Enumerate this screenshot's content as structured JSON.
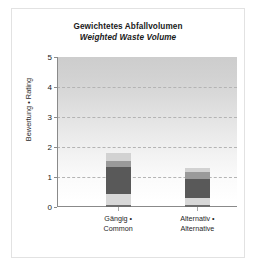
{
  "chart_data": {
    "type": "bar",
    "subtype": "stacked-bar",
    "title": "Gewichtetes Abfallvolumen",
    "subtitle": "Weighted Waste Volume",
    "xlabel": "",
    "ylabel": "Bewertung • Rating",
    "ylim": [
      0,
      5
    ],
    "yticks": [
      "0",
      "1",
      "2",
      "3",
      "4",
      "5"
    ],
    "grid": "horizontal-dashed",
    "legend": "none",
    "categories": [
      "Gängig •\nCommon",
      "Alternativ •\nAlternative"
    ],
    "category_labels": [
      {
        "line1": "Gängig •",
        "line2": "Common"
      },
      {
        "line1": "Alternativ •",
        "line2": "Alternative"
      }
    ],
    "totals": [
      1.8,
      1.3
    ],
    "series": [
      {
        "name": "segment-1-base",
        "values": [
          0.07,
          0.06
        ],
        "color": "#6e6e6e"
      },
      {
        "name": "segment-2",
        "values": [
          0.38,
          0.25
        ],
        "color": "#d8d8d8"
      },
      {
        "name": "segment-3-main",
        "values": [
          0.88,
          0.64
        ],
        "color": "#595959"
      },
      {
        "name": "segment-4",
        "values": [
          0.22,
          0.21
        ],
        "color": "#9a9a9a"
      },
      {
        "name": "segment-5-cap",
        "values": [
          0.25,
          0.14
        ],
        "color": "#d2d2d2"
      }
    ],
    "colors": {
      "plot_background_top": "#cdcdcd",
      "plot_background_bottom": "#ffffff",
      "gridline": "#b4b4b4",
      "axis": "#8a8a8a",
      "frame": "#e2e2e2",
      "text": "#1a1a1a"
    }
  }
}
